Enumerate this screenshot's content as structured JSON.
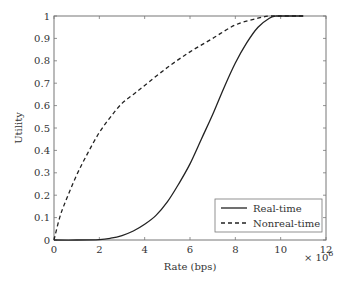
{
  "chart_data": {
    "type": "line",
    "title": "",
    "xlabel": "Rate (bps)",
    "ylabel": "Utility",
    "x_multiplier_label": "× 10",
    "x_multiplier_exp": "6",
    "xlim": [
      0,
      12
    ],
    "ylim": [
      0,
      1
    ],
    "xticks": [
      "0",
      "2",
      "4",
      "6",
      "8",
      "10",
      "12"
    ],
    "yticks": [
      "0",
      "0.1",
      "0.2",
      "0.3",
      "0.4",
      "0.5",
      "0.6",
      "0.7",
      "0.8",
      "0.9",
      "1"
    ],
    "grid": false,
    "legend_position": "lower right",
    "series": [
      {
        "name": "Real-time",
        "style": "solid",
        "x": [
          0,
          1,
          2,
          2.5,
          3,
          3.5,
          4,
          4.5,
          5,
          5.5,
          6,
          6.5,
          7,
          7.5,
          8,
          8.5,
          9,
          9.5,
          9.8,
          10,
          11
        ],
        "values": [
          0,
          0,
          0.002,
          0.008,
          0.02,
          0.04,
          0.07,
          0.11,
          0.17,
          0.25,
          0.34,
          0.45,
          0.56,
          0.68,
          0.79,
          0.88,
          0.95,
          0.99,
          1.0,
          1.0,
          1.0
        ]
      },
      {
        "name": "Nonreal-time",
        "style": "dashed",
        "x": [
          0,
          0.25,
          0.5,
          1,
          1.5,
          2,
          2.5,
          3,
          3.5,
          4,
          5,
          6,
          7,
          8,
          9,
          9.5,
          10,
          11
        ],
        "values": [
          0,
          0.1,
          0.17,
          0.29,
          0.39,
          0.48,
          0.55,
          0.61,
          0.65,
          0.69,
          0.77,
          0.84,
          0.9,
          0.96,
          0.99,
          1.0,
          1.0,
          1.0
        ]
      }
    ]
  },
  "legend": {
    "items": [
      {
        "label": "Real-time",
        "style": "solid"
      },
      {
        "label": "Nonreal-time",
        "style": "dashed"
      }
    ]
  }
}
